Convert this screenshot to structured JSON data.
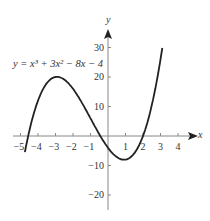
{
  "chart_data": {
    "type": "line",
    "title": "",
    "equation_label": "y = x³ + 3x² − 8x − 4",
    "xlabel": "x",
    "ylabel": "y",
    "xlim": [
      -5.3,
      4.8
    ],
    "ylim": [
      -25,
      35
    ],
    "x_ticks": [
      -5,
      -4,
      -3,
      -2,
      -1,
      1,
      2,
      3,
      4
    ],
    "y_ticks": [
      30,
      20,
      10,
      -10,
      -20
    ],
    "grid": false,
    "series": [
      {
        "name": "y = x^3 + 3x^2 - 8x - 4",
        "x": [
          -4.75,
          -4.5,
          -4,
          -3.5,
          -3,
          -2.5,
          -2,
          -1.5,
          -1,
          -0.5,
          0,
          0.5,
          1,
          1.5,
          2,
          2.5,
          3,
          3.1
        ],
        "y": [
          -14.5,
          -6.6,
          12,
          19.6,
          20,
          17.4,
          16,
          12.9,
          6,
          -0.4,
          -4,
          -6.1,
          -8,
          -5.9,
          0,
          10.9,
          26,
          28.1
        ]
      }
    ]
  },
  "labels": {
    "equation": "y = x³ + 3x² − 8x − 4",
    "x_axis": "x",
    "y_axis": "y",
    "x_ticks": [
      "−5",
      "−4",
      "−3",
      "−2",
      "−1",
      "1",
      "2",
      "3",
      "4"
    ],
    "y_ticks": [
      "30",
      "20",
      "10",
      "−10",
      "−20"
    ]
  }
}
